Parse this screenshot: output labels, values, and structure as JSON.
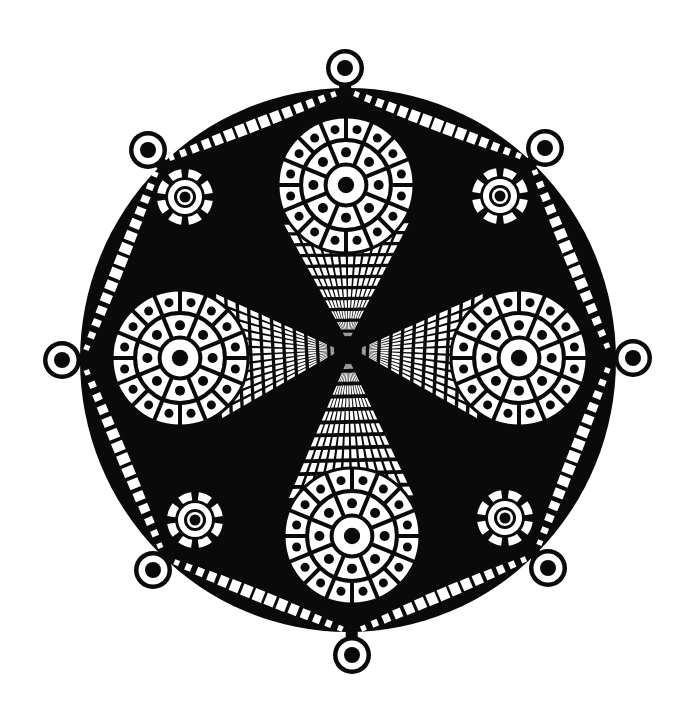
{
  "canvas": {
    "width": 688,
    "height": 719,
    "background": "#ffffff"
  },
  "colors": {
    "ink": "#0a0a0a",
    "paper": "#ffffff"
  },
  "disc": {
    "cx": 348,
    "cy": 360,
    "rx": 268,
    "ry": 272
  },
  "center": {
    "cx": 348,
    "cy": 350
  },
  "knobs": [
    {
      "name": "knob-top",
      "cx": 345,
      "cy": 68
    },
    {
      "name": "knob-top-right",
      "cx": 545,
      "cy": 148
    },
    {
      "name": "knob-right",
      "cx": 633,
      "cy": 358
    },
    {
      "name": "knob-bottom-right",
      "cx": 548,
      "cy": 568
    },
    {
      "name": "knob-bottom",
      "cx": 352,
      "cy": 655
    },
    {
      "name": "knob-bottom-left",
      "cx": 153,
      "cy": 570
    },
    {
      "name": "knob-left",
      "cx": 62,
      "cy": 360
    },
    {
      "name": "knob-top-left",
      "cx": 148,
      "cy": 150
    }
  ],
  "knob_style": {
    "outer_r": 19,
    "ring_w": 4.5,
    "dot_r": 8
  },
  "octagon_vertices": [
    [
      345,
      90
    ],
    [
      530,
      160
    ],
    [
      612,
      358
    ],
    [
      535,
      555
    ],
    [
      352,
      633
    ],
    [
      165,
      558
    ],
    [
      82,
      360
    ],
    [
      160,
      162
    ]
  ],
  "lobes": [
    {
      "name": "lobe-top",
      "cx": 346,
      "cy": 185,
      "r": 68,
      "tip": [
        348,
        350
      ]
    },
    {
      "name": "lobe-right",
      "cx": 519,
      "cy": 358,
      "r": 68,
      "tip": [
        348,
        350
      ]
    },
    {
      "name": "lobe-bottom",
      "cx": 352,
      "cy": 536,
      "r": 68,
      "tip": [
        348,
        350
      ]
    },
    {
      "name": "lobe-left",
      "cx": 180,
      "cy": 358,
      "r": 68,
      "tip": [
        348,
        350
      ]
    }
  ],
  "rosettes": [
    {
      "name": "rosette-top-left",
      "cx": 185,
      "cy": 197
    },
    {
      "name": "rosette-top-right",
      "cx": 500,
      "cy": 196
    },
    {
      "name": "rosette-bottom-right",
      "cx": 505,
      "cy": 518
    },
    {
      "name": "rosette-bottom-left",
      "cx": 195,
      "cy": 520
    }
  ],
  "rosette_style": {
    "outer_r": 28,
    "mid_r": 17,
    "inner_r": 11,
    "dot_r": 5.5,
    "segments": 8
  }
}
